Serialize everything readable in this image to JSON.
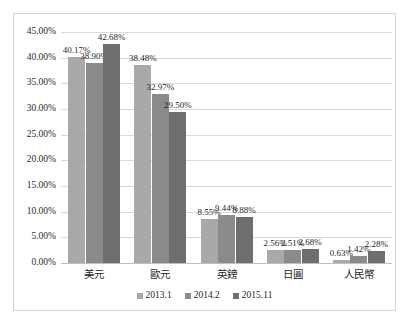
{
  "chart_data": {
    "type": "bar",
    "title": "",
    "xlabel": "",
    "ylabel": "",
    "ylim": [
      0,
      45
    ],
    "ytick_labels": [
      "0.00%",
      "5.00%",
      "10.00%",
      "15.00%",
      "20.00%",
      "25.00%",
      "30.00%",
      "35.00%",
      "40.00%",
      "45.00%"
    ],
    "ytick_values": [
      0,
      5,
      10,
      15,
      20,
      25,
      30,
      35,
      40,
      45
    ],
    "grid": true,
    "legend_position": "bottom",
    "categories": [
      "美元",
      "歐元",
      "英鎊",
      "日圓",
      "人民幣"
    ],
    "series": [
      {
        "name": "2013.1",
        "color": "#a9a9a9",
        "values": [
          40.17,
          38.48,
          8.55,
          2.56,
          0.63
        ],
        "labels": [
          "40.17%",
          "38.48%",
          "8.55%",
          "2.56%",
          "0.63%"
        ]
      },
      {
        "name": "2014.2",
        "color": "#8b8b8b",
        "values": [
          38.9,
          32.97,
          9.44,
          2.51,
          1.42
        ],
        "labels": [
          "38.90%",
          "32.97%",
          "9.44%",
          "2.51%",
          "1.42%"
        ]
      },
      {
        "name": "2015.11",
        "color": "#6e6e6e",
        "values": [
          42.68,
          29.5,
          8.88,
          2.68,
          2.28
        ],
        "labels": [
          "42.68%",
          "29.50%",
          "8.88%",
          "2.68%",
          "2.28%"
        ]
      }
    ]
  },
  "colors": {
    "series_1": "#a9a9a9",
    "series_2": "#8b8b8b",
    "series_3": "#6e6e6e",
    "gridline": "#d9d9d9",
    "border": "#d4d4d4",
    "text": "#1f1f1f",
    "background": "#ffffff"
  }
}
